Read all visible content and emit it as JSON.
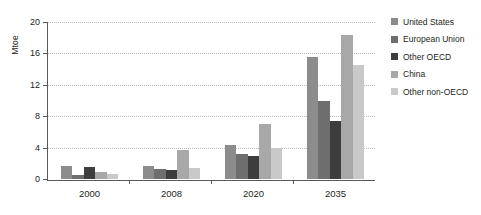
{
  "chart_data": {
    "type": "bar",
    "title": "",
    "subtitle": "",
    "xlabel": "",
    "ylabel": "Mtoe",
    "ylim": [
      0,
      20
    ],
    "yticks": [
      0,
      4,
      8,
      12,
      16,
      20
    ],
    "grid": true,
    "legend_position": "right",
    "categories": [
      "2000",
      "2008",
      "2020",
      "2035"
    ],
    "series": [
      {
        "name": "United States",
        "color": "#8c8c8c",
        "values": [
          1.6,
          1.7,
          4.3,
          15.6
        ]
      },
      {
        "name": "European Union",
        "color": "#6e6e6e",
        "values": [
          0.5,
          1.3,
          3.2,
          9.9
        ]
      },
      {
        "name": "Other OECD",
        "color": "#3d3d3d",
        "values": [
          1.5,
          1.2,
          2.9,
          7.4
        ]
      },
      {
        "name": "China",
        "color": "#a8a8a8",
        "values": [
          0.9,
          3.7,
          7.0,
          18.3
        ]
      },
      {
        "name": "Other non-OECD",
        "color": "#c9c9c9",
        "values": [
          0.7,
          1.4,
          3.9,
          14.5
        ]
      }
    ]
  },
  "axis": {
    "axis_color": "#58595b",
    "gridline_color": "#b9bcbe"
  }
}
